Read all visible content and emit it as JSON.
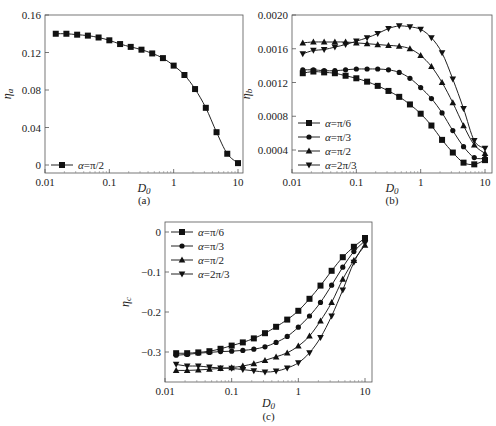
{
  "chart_data": [
    {
      "id": "a",
      "type": "line",
      "caption": "(a)",
      "xlabel": "D0",
      "ylabel": "ηa",
      "xscale": "log",
      "xlim": [
        0.01,
        10
      ],
      "ylim": [
        -0.01,
        0.16
      ],
      "xticks": [
        "0.01",
        "0.1",
        "1",
        "10"
      ],
      "yticks": [
        "0",
        "0.04",
        "0.08",
        "0.12",
        "0.16"
      ],
      "legend_position": "lower left",
      "x": [
        0.0147,
        0.0215,
        0.0316,
        0.0464,
        0.0681,
        0.1,
        0.147,
        0.215,
        0.316,
        0.464,
        0.681,
        1.0,
        1.47,
        2.15,
        3.16,
        4.64,
        6.81,
        10.0
      ],
      "series": [
        {
          "name": "α=π/2",
          "marker": "square",
          "values": [
            0.14,
            0.14,
            0.139,
            0.138,
            0.136,
            0.133,
            0.129,
            0.126,
            0.123,
            0.119,
            0.114,
            0.106,
            0.096,
            0.081,
            0.061,
            0.035,
            0.012,
            0.002
          ]
        }
      ]
    },
    {
      "id": "b",
      "type": "line",
      "caption": "(b)",
      "xlabel": "D0",
      "ylabel": "ηb",
      "xscale": "log",
      "xlim": [
        0.01,
        10
      ],
      "ylim": [
        0.00013,
        0.002
      ],
      "xticks": [
        "0.01",
        "0.1",
        "1",
        "10"
      ],
      "yticks": [
        "0.0004",
        "0.0008",
        "0.0012",
        "0.0016",
        "0.0020"
      ],
      "legend_position": "lower left",
      "x": [
        0.0147,
        0.0215,
        0.0316,
        0.0464,
        0.0681,
        0.1,
        0.147,
        0.215,
        0.316,
        0.464,
        0.681,
        1.0,
        1.47,
        2.15,
        3.16,
        4.64,
        6.81,
        10.0
      ],
      "series": [
        {
          "name": "α=π/6",
          "marker": "square",
          "values": [
            0.00131,
            0.00133,
            0.00132,
            0.00131,
            0.00128,
            0.00125,
            0.00121,
            0.00116,
            0.0011,
            0.00103,
            0.00094,
            0.00083,
            0.00069,
            0.00052,
            0.00037,
            0.00025,
            0.00023,
            0.00028
          ]
        },
        {
          "name": "α=π/3",
          "marker": "circle",
          "values": [
            0.00135,
            0.00135,
            0.00134,
            0.00134,
            0.00135,
            0.00136,
            0.00136,
            0.00136,
            0.00135,
            0.00132,
            0.00125,
            0.00114,
            0.00101,
            0.00084,
            0.00063,
            0.00044,
            0.00031,
            0.0003
          ]
        },
        {
          "name": "α=π/2",
          "marker": "triangle-up",
          "values": [
            0.00167,
            0.00168,
            0.00168,
            0.00168,
            0.00168,
            0.00167,
            0.00166,
            0.00165,
            0.00164,
            0.00163,
            0.0016,
            0.00152,
            0.00139,
            0.0012,
            0.00096,
            0.00069,
            0.00046,
            0.00036
          ]
        },
        {
          "name": "α=2π/3",
          "marker": "triangle-down",
          "values": [
            0.00154,
            0.00158,
            0.00159,
            0.00162,
            0.00165,
            0.00169,
            0.00173,
            0.00178,
            0.00184,
            0.00187,
            0.00186,
            0.00183,
            0.00173,
            0.00155,
            0.00124,
            0.00089,
            0.00051,
            0.00042
          ]
        }
      ]
    },
    {
      "id": "c",
      "type": "line",
      "caption": "(c)",
      "xlabel": "D0",
      "ylabel": "ηc",
      "xscale": "log",
      "xlim": [
        0.01,
        10
      ],
      "ylim": [
        -0.375,
        0.025
      ],
      "xticks": [
        "0.01",
        "0.1",
        "1",
        "10"
      ],
      "yticks": [
        "-0.3",
        "-0.2",
        "-0.1",
        "0"
      ],
      "legend_position": "upper left",
      "x": [
        0.0147,
        0.0215,
        0.0316,
        0.0464,
        0.0681,
        0.1,
        0.147,
        0.215,
        0.316,
        0.464,
        0.681,
        1.0,
        1.47,
        2.15,
        3.16,
        4.64,
        6.81,
        10.0
      ],
      "series": [
        {
          "name": "α=π/6",
          "marker": "square",
          "values": [
            -0.303,
            -0.303,
            -0.301,
            -0.298,
            -0.292,
            -0.284,
            -0.276,
            -0.266,
            -0.253,
            -0.237,
            -0.219,
            -0.197,
            -0.167,
            -0.134,
            -0.097,
            -0.063,
            -0.037,
            -0.015
          ]
        },
        {
          "name": "α=π/3",
          "marker": "circle",
          "values": [
            -0.308,
            -0.306,
            -0.303,
            -0.301,
            -0.299,
            -0.298,
            -0.296,
            -0.293,
            -0.287,
            -0.276,
            -0.261,
            -0.238,
            -0.21,
            -0.176,
            -0.133,
            -0.088,
            -0.049,
            -0.022
          ]
        },
        {
          "name": "α=π/2",
          "marker": "triangle-up",
          "values": [
            -0.346,
            -0.346,
            -0.345,
            -0.343,
            -0.341,
            -0.339,
            -0.335,
            -0.329,
            -0.321,
            -0.312,
            -0.302,
            -0.285,
            -0.26,
            -0.222,
            -0.176,
            -0.118,
            -0.071,
            -0.033
          ]
        },
        {
          "name": "α=2π/3",
          "marker": "triangle-down",
          "values": [
            -0.331,
            -0.335,
            -0.335,
            -0.338,
            -0.34,
            -0.341,
            -0.344,
            -0.347,
            -0.35,
            -0.348,
            -0.34,
            -0.327,
            -0.302,
            -0.264,
            -0.21,
            -0.145,
            -0.076,
            -0.028
          ]
        }
      ]
    }
  ]
}
